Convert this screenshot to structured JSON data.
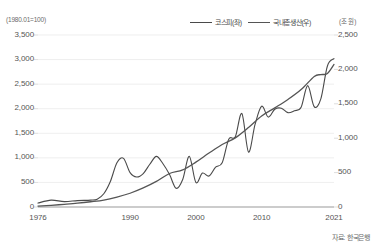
{
  "chart_data": {
    "type": "line",
    "title": "",
    "subtitle": "",
    "xlabel": "",
    "ylabel": "",
    "grid": true,
    "legend_position": "top-right",
    "left_axis": {
      "unit_label": "(1980.01=100)",
      "ticks": [
        "0",
        "500",
        "1,000",
        "1,500",
        "2,000",
        "2,500",
        "3,000",
        "3,500"
      ],
      "tick_values": [
        0,
        500,
        1000,
        1500,
        2000,
        2500,
        3000,
        3500
      ],
      "ylim": [
        0,
        3500
      ]
    },
    "right_axis": {
      "unit_label": "(조 원)",
      "ticks": [
        "0",
        "500",
        "1,000",
        "1,500",
        "2,000",
        "2,500"
      ],
      "tick_values": [
        0,
        500,
        1000,
        1500,
        2000,
        2500
      ],
      "ylim": [
        0,
        2500
      ]
    },
    "x_ticks": [
      "1976",
      "1990",
      "2000",
      "2010",
      "2021"
    ],
    "x_tick_values": [
      1976,
      1990,
      2000,
      2010,
      2021
    ],
    "xlim": [
      1976,
      2021
    ],
    "series": [
      {
        "name": "코스피(좌)",
        "axis": "left",
        "color": "#4a4a4a",
        "width": 1.1,
        "x": [
          1976,
          1978,
          1980,
          1982,
          1984,
          1985,
          1986,
          1987,
          1988,
          1989,
          1990,
          1991,
          1992,
          1993,
          1994,
          1995,
          1996,
          1997,
          1998,
          1999,
          2000,
          2001,
          2002,
          2003,
          2004,
          2005,
          2006,
          2007,
          2008,
          2009,
          2010,
          2011,
          2012,
          2013,
          2014,
          2015,
          2016,
          2017,
          2018,
          2019,
          2020,
          2021
        ],
        "values": [
          80,
          140,
          110,
          130,
          140,
          160,
          270,
          520,
          900,
          990,
          700,
          610,
          680,
          870,
          1030,
          880,
          660,
          380,
          560,
          1030,
          500,
          690,
          630,
          810,
          900,
          1380,
          1430,
          1900,
          1120,
          1680,
          2050,
          1830,
          1990,
          2010,
          1920,
          1960,
          2030,
          2470,
          2040,
          2200,
          2870,
          3020
        ]
      },
      {
        "name": "국내총생산(우)",
        "axis": "right",
        "color": "#555555",
        "width": 1.3,
        "x": [
          1976,
          1978,
          1980,
          1982,
          1984,
          1986,
          1988,
          1990,
          1992,
          1994,
          1996,
          1998,
          2000,
          2002,
          2004,
          2006,
          2008,
          2010,
          2012,
          2014,
          2016,
          2018,
          2019,
          2020,
          2021
        ],
        "values": [
          14,
          25,
          39,
          55,
          76,
          101,
          144,
          200,
          277,
          372,
          487,
          539,
          652,
          784,
          908,
          1005,
          1154,
          1323,
          1441,
          1563,
          1707,
          1898,
          1924,
          1941,
          2072
        ]
      }
    ]
  },
  "source": {
    "note": "자료: 한국은행"
  }
}
